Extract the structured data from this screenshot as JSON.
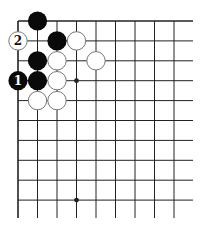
{
  "diagram": {
    "type": "go-board-corner",
    "grid": {
      "origin_x": 18,
      "origin_y": 21,
      "spacing_x": 19.5,
      "spacing_y": 19.9,
      "cols": 10,
      "rows": 10,
      "right_end_x": 193,
      "bottom_end_y": 218,
      "edges": [
        "top",
        "left"
      ]
    },
    "colors": {
      "line": "#222222",
      "black_stone": "#0a0a0a",
      "white_stone_fill": "#ffffff",
      "white_stone_stroke": "#777777",
      "label_on_black": "#ffffff",
      "label_on_white": "#111111"
    },
    "stones": [
      {
        "color": "black",
        "col": 1,
        "row": 0,
        "label": ""
      },
      {
        "color": "white",
        "col": 0,
        "row": 1,
        "label": "2"
      },
      {
        "color": "black",
        "col": 2,
        "row": 1,
        "label": ""
      },
      {
        "color": "white",
        "col": 3,
        "row": 1,
        "label": ""
      },
      {
        "color": "black",
        "col": 1,
        "row": 2,
        "label": ""
      },
      {
        "color": "white",
        "col": 2,
        "row": 2,
        "label": ""
      },
      {
        "color": "white",
        "col": 4,
        "row": 2,
        "label": ""
      },
      {
        "color": "black",
        "col": 0,
        "row": 3,
        "label": "1"
      },
      {
        "color": "black",
        "col": 1,
        "row": 3,
        "label": ""
      },
      {
        "color": "white",
        "col": 2,
        "row": 3,
        "label": ""
      },
      {
        "color": "white",
        "col": 1,
        "row": 4,
        "label": ""
      },
      {
        "color": "white",
        "col": 2,
        "row": 4,
        "label": ""
      }
    ],
    "hoshi": [
      {
        "col": 3,
        "row": 3
      },
      {
        "col": 3,
        "row": 9
      }
    ]
  }
}
